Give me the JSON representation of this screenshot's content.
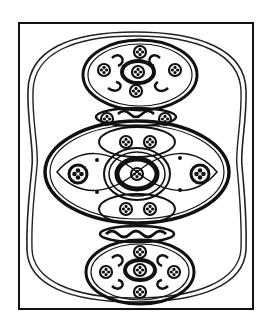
{
  "image": {
    "subject": "Celtic ornamental shield design",
    "description": "Line drawing of a shield with three circular/elliptical roundels bearing triskele and floral motifs, enclosed by a waisted double-line border inside a rectangular frame",
    "colors": {
      "ink": "#111111",
      "background": "#ffffff"
    }
  }
}
